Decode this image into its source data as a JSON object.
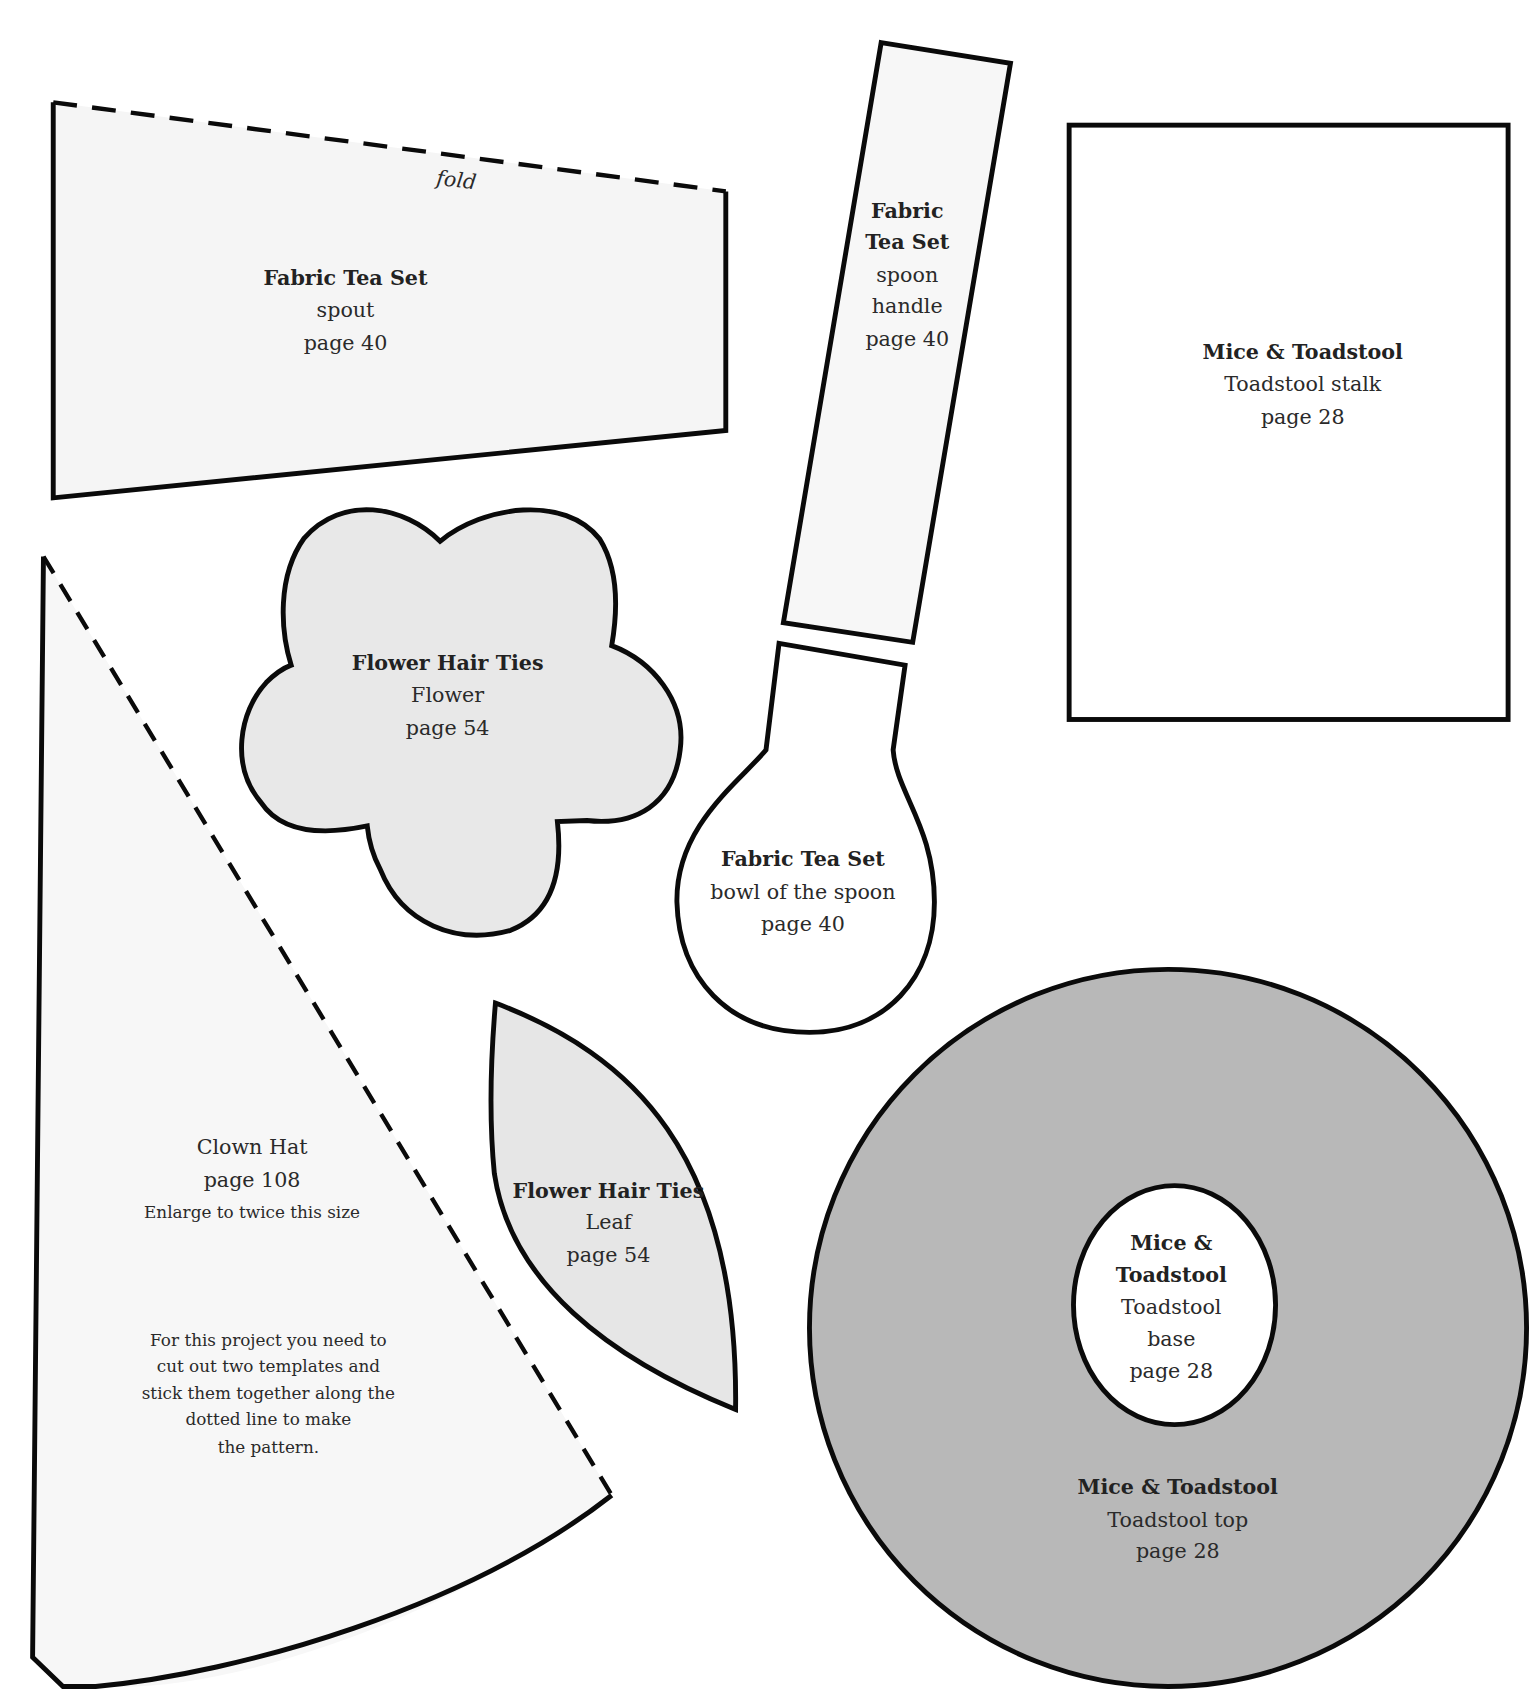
{
  "page": {
    "type": "sewing-pattern-templates-sheet",
    "colors": {
      "background": "#ffffff",
      "outline": "#0a0a0a",
      "light_fill": "#f5f5f5",
      "flower_fill": "#e8e8e8",
      "leaf_fill": "#e6e6e6",
      "toadstool_top_fill": "#b8b8b8",
      "text": "#2a2a2a"
    }
  },
  "templates": {
    "spout": {
      "project": "Fabric Tea Set",
      "part": "spout",
      "page": "page 40",
      "fold_label": "fold"
    },
    "spoon_handle": {
      "project_line1": "Fabric",
      "project_line2": "Tea Set",
      "part_line1": "spoon",
      "part_line2": "handle",
      "page": "page 40"
    },
    "toadstool_stalk": {
      "project": "Mice & Toadstool",
      "part": "Toadstool stalk",
      "page": "page 28"
    },
    "flower": {
      "project": "Flower Hair Ties",
      "part": "Flower",
      "page": "page 54"
    },
    "spoon_bowl": {
      "project": "Fabric Tea Set",
      "part": "bowl of the spoon",
      "page": "page 40"
    },
    "clown_hat": {
      "project": "Clown Hat",
      "page": "page 108",
      "note": "Enlarge to twice this size",
      "instructions": [
        "For this project you need to",
        "cut out two templates and",
        "stick them together along the",
        "dotted line to make",
        "the pattern."
      ]
    },
    "leaf": {
      "project": "Flower Hair Ties",
      "part": "Leaf",
      "page": "page 54"
    },
    "toadstool_base": {
      "project_line1": "Mice &",
      "project_line2": "Toadstool",
      "part_line1": "Toadstool",
      "part_line2": "base",
      "page": "page 28"
    },
    "toadstool_top": {
      "project": "Mice & Toadstool",
      "part": "Toadstool top",
      "page": "page 28"
    }
  }
}
